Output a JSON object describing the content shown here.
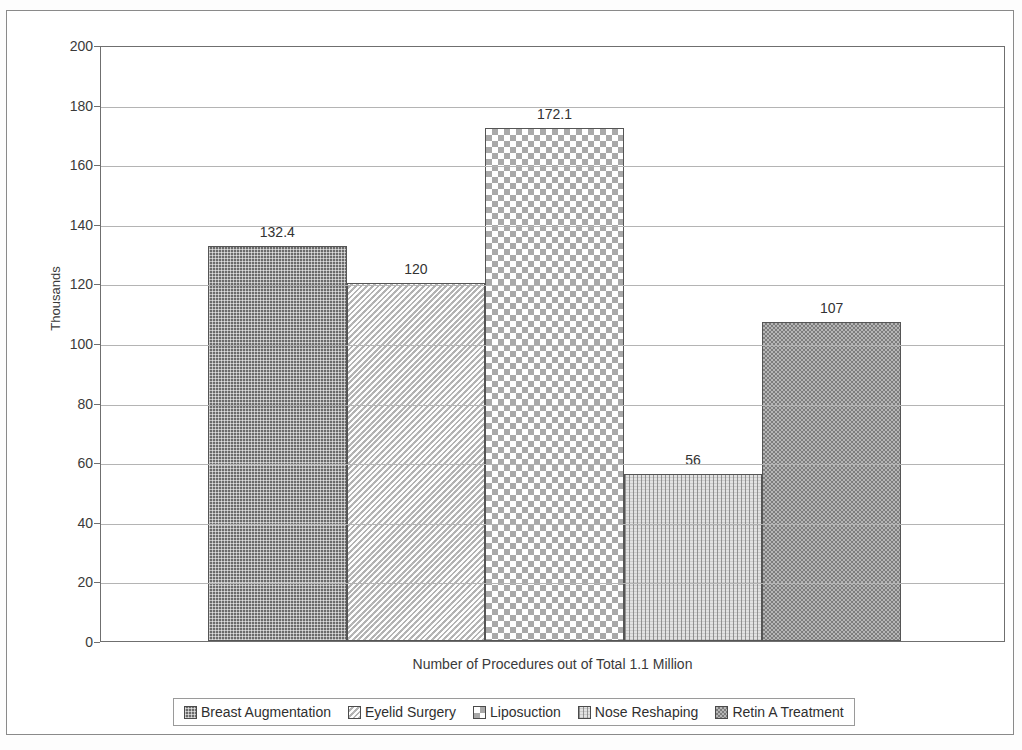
{
  "chart_data": {
    "type": "bar",
    "title": "",
    "xlabel": "Number of Procedures out of Total 1.1 Million",
    "ylabel": "Thousands",
    "categories": [
      "Breast Augmentation",
      "Eyelid Surgery",
      "Liposuction",
      "Nose Reshaping",
      "Retin A Treatment"
    ],
    "values": [
      132.4,
      120,
      172.1,
      56,
      107
    ],
    "value_labels": [
      "132.4",
      "120",
      "172.1",
      "56",
      "107"
    ],
    "ylim": [
      0,
      200
    ],
    "ytick_step": 20,
    "yticks": [
      "200",
      "180",
      "160",
      "140",
      "120",
      "100",
      "80",
      "60",
      "40",
      "20",
      "0"
    ],
    "grid": true,
    "legend_position": "bottom",
    "series": [
      {
        "name": "Breast Augmentation",
        "value": 132.4,
        "pattern": "fine-dot-dark",
        "color": "#6b6b6b"
      },
      {
        "name": "Eyelid Surgery",
        "value": 120,
        "pattern": "diagonal-light",
        "color": "#d2d2d2"
      },
      {
        "name": "Liposuction",
        "value": 172.1,
        "pattern": "large-checker",
        "color": "#a9a9a9"
      },
      {
        "name": "Nose Reshaping",
        "value": 56,
        "pattern": "vertical-stripe-light",
        "color": "#e2e2e2"
      },
      {
        "name": "Retin A Treatment",
        "value": 107,
        "pattern": "fine-checker",
        "color": "#8f8f8f"
      }
    ]
  },
  "axes": {
    "y_title": "Thousands",
    "x_title": "Number of Procedures out of Total 1.1 Million"
  },
  "legend": {
    "items": [
      {
        "label": "Breast Augmentation"
      },
      {
        "label": "Eyelid Surgery"
      },
      {
        "label": "Liposuction"
      },
      {
        "label": "Nose Reshaping"
      },
      {
        "label": "Retin A Treatment"
      }
    ]
  }
}
